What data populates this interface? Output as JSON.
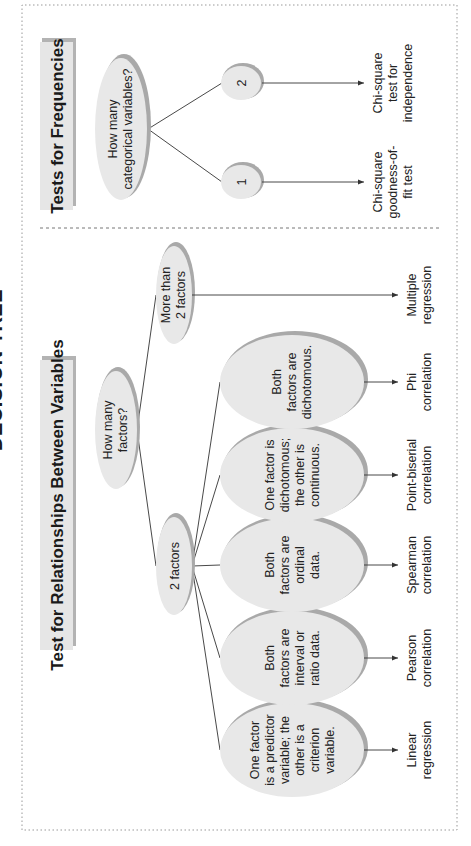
{
  "page_title": "DECISION TREE",
  "colors": {
    "ellipse_fill": "#e8e8e8",
    "ellipse_shadow": "#a9a9a9",
    "title_box": "#e6e6e6",
    "line": "#333333"
  },
  "relationships": {
    "title": "Test for Relationships Between Variables",
    "question": [
      "How many",
      "factors?"
    ],
    "branch_two": [
      "2 factors"
    ],
    "branch_more": [
      "More than",
      "2 factors"
    ],
    "conditions": [
      {
        "lines": [
          "One factor",
          "is a predictor",
          "variable; the",
          "other is a",
          "criterion",
          "variable."
        ],
        "result": [
          "Linear",
          "regression"
        ]
      },
      {
        "lines": [
          "Both",
          "factors are",
          "interval or",
          "ratio data."
        ],
        "result": [
          "Pearson",
          "correlation"
        ]
      },
      {
        "lines": [
          "Both",
          "factors are",
          "ordinal",
          "data."
        ],
        "result": [
          "Spearman",
          "correlation"
        ]
      },
      {
        "lines": [
          "One factor is",
          "dichotomous;",
          "the other is",
          "continuous."
        ],
        "result": [
          "Point-biserial",
          "correlation"
        ]
      },
      {
        "lines": [
          "Both",
          "factors are",
          "dichotomous."
        ],
        "result": [
          "Phi",
          "correlation"
        ]
      }
    ],
    "more_result": [
      "Multiple",
      "regression"
    ]
  },
  "frequencies": {
    "title": "Tests for Frequencies",
    "question": [
      "How many",
      "categorical variables?"
    ],
    "branches": [
      {
        "label": "1",
        "result": [
          "Chi-square",
          "goodness-of-",
          "fit test"
        ]
      },
      {
        "label": "2",
        "result": [
          "Chi-square",
          "test for",
          "independence"
        ]
      }
    ]
  }
}
